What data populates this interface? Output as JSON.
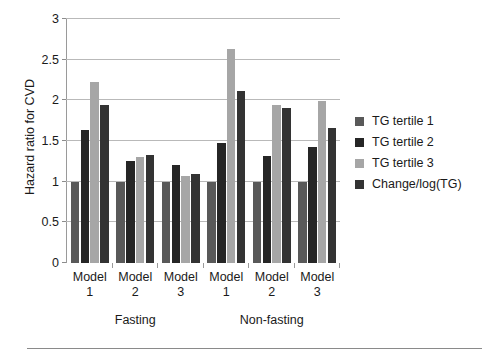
{
  "chart_data": {
    "type": "bar",
    "title": "",
    "xlabel": "",
    "ylabel": "Hazard ratio for CVD",
    "ylim": [
      0,
      3
    ],
    "yticks": [
      "0",
      "0.5",
      "1",
      "1.5",
      "2",
      "2.5",
      "3"
    ],
    "ytick_values": [
      0,
      0.5,
      1,
      1.5,
      2,
      2.5,
      3
    ],
    "grid": "horizontal",
    "legend_position": "right",
    "categories": [
      "Model 1",
      "Model 2",
      "Model 3",
      "Model 1",
      "Model 2",
      "Model 3"
    ],
    "category_lines": [
      [
        "Model",
        "1"
      ],
      [
        "Model",
        "2"
      ],
      [
        "Model",
        "3"
      ],
      [
        "Model",
        "1"
      ],
      [
        "Model",
        "2"
      ],
      [
        "Model",
        "3"
      ]
    ],
    "groups": [
      {
        "label": "Fasting",
        "categories": [
          "Model 1",
          "Model 2",
          "Model 3"
        ]
      },
      {
        "label": "Non-fasting",
        "categories": [
          "Model 1",
          "Model 2",
          "Model 3"
        ]
      }
    ],
    "series": [
      {
        "name": "TG tertile 1",
        "color": "#595959",
        "values": [
          1.0,
          1.0,
          1.0,
          1.0,
          1.0,
          1.0
        ]
      },
      {
        "name": "TG tertile 2",
        "color": "#262626",
        "values": [
          1.63,
          1.26,
          1.2,
          1.47,
          1.31,
          1.43
        ]
      },
      {
        "name": "TG tertile 3",
        "color": "#a6a6a6",
        "values": [
          2.22,
          1.3,
          1.07,
          2.63,
          1.94,
          1.99
        ]
      },
      {
        "name": "Change/log(TG)",
        "color": "#333333",
        "values": [
          1.94,
          1.33,
          1.09,
          2.11,
          1.9,
          1.66
        ]
      }
    ]
  }
}
